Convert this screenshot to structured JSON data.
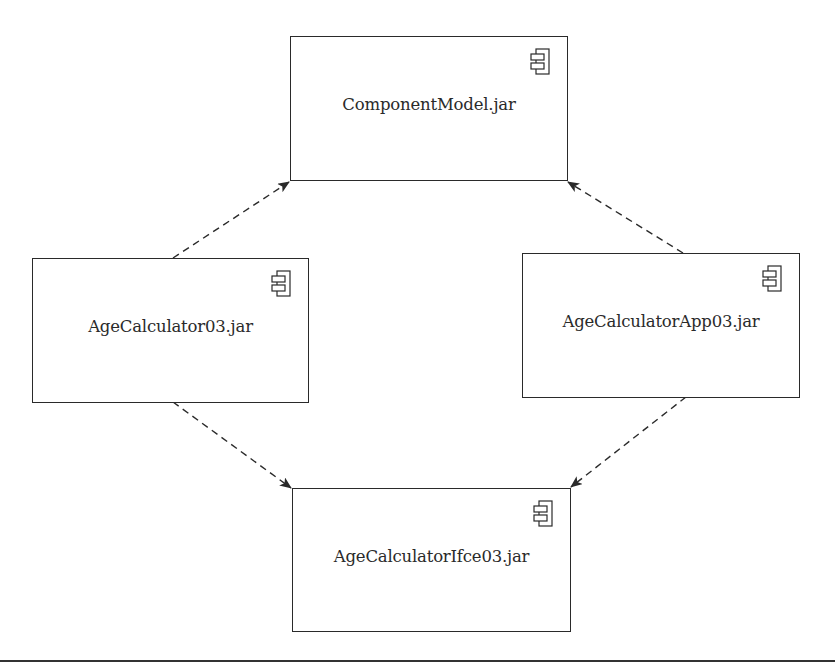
{
  "diagram": {
    "type": "uml-component-diagram",
    "components": [
      {
        "id": "component-model",
        "label": "ComponentModel.jar",
        "icon": "uml-component-icon"
      },
      {
        "id": "age-calculator",
        "label": "AgeCalculator03.jar",
        "icon": "uml-component-icon"
      },
      {
        "id": "age-calculator-app",
        "label": "AgeCalculatorApp03.jar",
        "icon": "uml-component-icon"
      },
      {
        "id": "age-calculator-ifce",
        "label": "AgeCalculatorIfce03.jar",
        "icon": "uml-component-icon"
      }
    ],
    "dependencies": [
      {
        "from": "AgeCalculator03.jar",
        "to": "ComponentModel.jar",
        "style": "dashed-arrow"
      },
      {
        "from": "AgeCalculatorApp03.jar",
        "to": "ComponentModel.jar",
        "style": "dashed-arrow"
      },
      {
        "from": "AgeCalculator03.jar",
        "to": "AgeCalculatorIfce03.jar",
        "style": "dashed-arrow"
      },
      {
        "from": "AgeCalculatorApp03.jar",
        "to": "AgeCalculatorIfce03.jar",
        "style": "dashed-arrow"
      }
    ],
    "colors": {
      "stroke": "#2a2a2a",
      "background": "#ffffff"
    }
  }
}
